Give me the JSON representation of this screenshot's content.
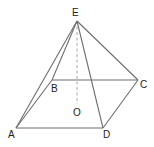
{
  "diagram": {
    "type": "geometry",
    "colors": {
      "edge": "#6e6e6e",
      "dashed": "#a8a8a8",
      "label": "#222222",
      "background": "#ffffff"
    },
    "points": {
      "E": {
        "label": "E",
        "x": 77,
        "y": 21
      },
      "A": {
        "label": "A",
        "x": 16,
        "y": 128
      },
      "B": {
        "label": "B",
        "x": 52,
        "y": 80
      },
      "C": {
        "label": "C",
        "x": 138,
        "y": 80
      },
      "D": {
        "label": "D",
        "x": 103,
        "y": 128
      },
      "O": {
        "label": "O",
        "x": 77,
        "y": 106
      }
    },
    "labels": {
      "E": "E",
      "A": "A",
      "B": "B",
      "C": "C",
      "D": "D",
      "O": "O"
    },
    "edges_solid": [
      "EA",
      "EB",
      "EC",
      "ED",
      "AB",
      "BC",
      "CD",
      "DA"
    ],
    "edges_dashed": [
      "EO"
    ]
  }
}
